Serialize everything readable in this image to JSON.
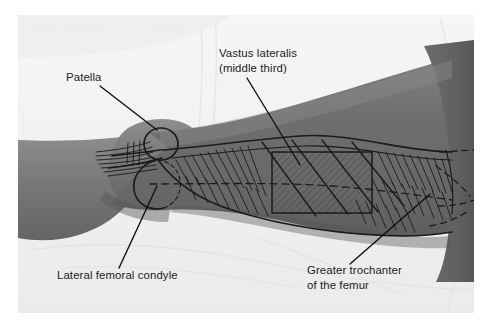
{
  "figure": {
    "kind": "anatomical-photograph-with-overlay-diagram",
    "photo_border_color": "#ffffff",
    "sheet_color": "#f2f2f2",
    "skin_color": "#6f6f6f",
    "skin_highlight_color": "#8a8a8a",
    "skin_shadow_color": "#5a5a5a",
    "ink_color": "#1b1b1b"
  },
  "labels": [
    {
      "id": "patella",
      "lines": [
        "Patella"
      ],
      "x": 66,
      "y": 81,
      "anchor": "start"
    },
    {
      "id": "vastus-lateralis",
      "lines": [
        "Vastus lateralis",
        "(middle third)"
      ],
      "x": 219,
      "y": 57,
      "anchor": "start"
    },
    {
      "id": "lateral-femoral-condyle",
      "lines": [
        "Lateral femoral condyle"
      ],
      "x": 57,
      "y": 279,
      "anchor": "start"
    },
    {
      "id": "greater-trochanter",
      "lines": [
        "Greater trochanter",
        "of the femur"
      ],
      "x": 307,
      "y": 274,
      "anchor": "start"
    }
  ],
  "leader_lines": [
    {
      "id": "patella-leader",
      "x1": 100,
      "y1": 86,
      "x2": 157,
      "y2": 130
    },
    {
      "id": "vastus-lateralis-leader",
      "x1": 247,
      "y1": 78,
      "x2": 300,
      "y2": 165
    },
    {
      "id": "lateral-femoral-condyle-leader",
      "x1": 119,
      "y1": 268,
      "x2": 157,
      "y2": 186
    },
    {
      "id": "greater-trochanter-leader",
      "x1": 350,
      "y1": 264,
      "x2": 430,
      "y2": 194
    }
  ],
  "overlay": {
    "injection_site_label": "middle third of vastus lateralis",
    "hatch_rect": {
      "x": 272,
      "y": 152,
      "width": 100,
      "height": 61
    },
    "landmarks": [
      "patella",
      "lateral femoral condyle",
      "greater trochanter of the femur"
    ]
  }
}
